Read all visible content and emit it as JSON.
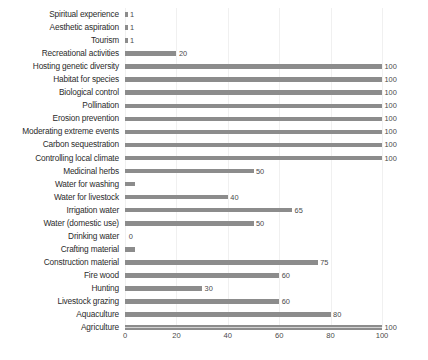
{
  "chart_data": {
    "type": "bar",
    "orientation": "horizontal",
    "title": "",
    "subtitle": "",
    "xlabel": "",
    "ylabel": "",
    "xlim": [
      0,
      100
    ],
    "xticks": [
      "0",
      "20",
      "40",
      "60",
      "80",
      "100"
    ],
    "xtick_values": [
      0,
      20,
      40,
      60,
      80,
      100
    ],
    "grid": true,
    "legend": "none",
    "bar_color": "#8c8c8c",
    "label_color": "#2b2b2b",
    "value_label_color": "#4a4a4a",
    "axis_color": "#d2d2d2",
    "show_value_labels": true,
    "categories": [
      "Spiritual experience",
      "Aesthetic aspiration",
      "Tourism",
      "Recreational activities",
      "Hosting genetic diversity",
      "Habitat for species",
      "Biological control",
      "Pollination",
      "Erosion prevention",
      "Moderating extreme events",
      "Carbon sequestration",
      "Controlling local climate",
      "Medicinal herbs",
      "Water for washing",
      "Water for livestock",
      "Irrigation water",
      "Water (domestic use)",
      "Drinking water",
      "Crafting material",
      "Construction material",
      "Fire wood",
      "Hunting",
      "Livestock grazing",
      "Aquaculture",
      "Agriculture"
    ],
    "values": [
      1,
      1,
      1,
      20,
      100,
      100,
      100,
      100,
      100,
      100,
      100,
      100,
      50,
      4,
      40,
      65,
      50,
      0,
      4,
      75,
      60,
      30,
      60,
      80,
      100
    ],
    "value_labels": [
      "1",
      "1",
      "1",
      "20",
      "100",
      "100",
      "100",
      "100",
      "100",
      "100",
      "100",
      "100",
      "50",
      "",
      "40",
      "65",
      "50",
      "0",
      "",
      "75",
      "60",
      "30",
      "60",
      "80",
      "100"
    ]
  }
}
